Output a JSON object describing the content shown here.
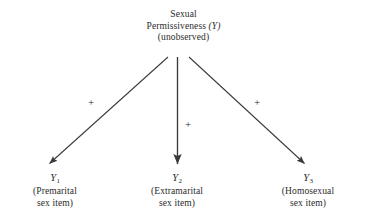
{
  "diagram": {
    "title_text": "Sexual Permissiveness (Y) (unobserved)",
    "latent": {
      "name": "sexual-permissiveness",
      "line1": "Sexual",
      "line2_plain": "Permissiveness",
      "line2_italic": "(Y)",
      "line3": "(unobserved)"
    },
    "indicators": [
      {
        "id": "y1",
        "symbol": "Y",
        "subscript": "1",
        "line1": "(Premarital",
        "line2": "sex item)"
      },
      {
        "id": "y2",
        "symbol": "Y",
        "subscript": "2",
        "line1": "(Extramarital",
        "line2": "sex item)"
      },
      {
        "id": "y3",
        "symbol": "Y",
        "subscript": "3",
        "line1": "(Homosexual",
        "line2": "sex item)"
      }
    ],
    "paths": [
      {
        "id": "path-left",
        "sign": "+",
        "from": "sexual-permissiveness",
        "to": "y1"
      },
      {
        "id": "path-mid",
        "sign": "+",
        "from": "sexual-permissiveness",
        "to": "y2"
      },
      {
        "id": "path-right",
        "sign": "+",
        "from": "sexual-permissiveness",
        "to": "y3"
      }
    ],
    "colors": {
      "background": "#ffffff",
      "text": "#2b2b2b",
      "arrow": "#3a3a3a"
    }
  }
}
